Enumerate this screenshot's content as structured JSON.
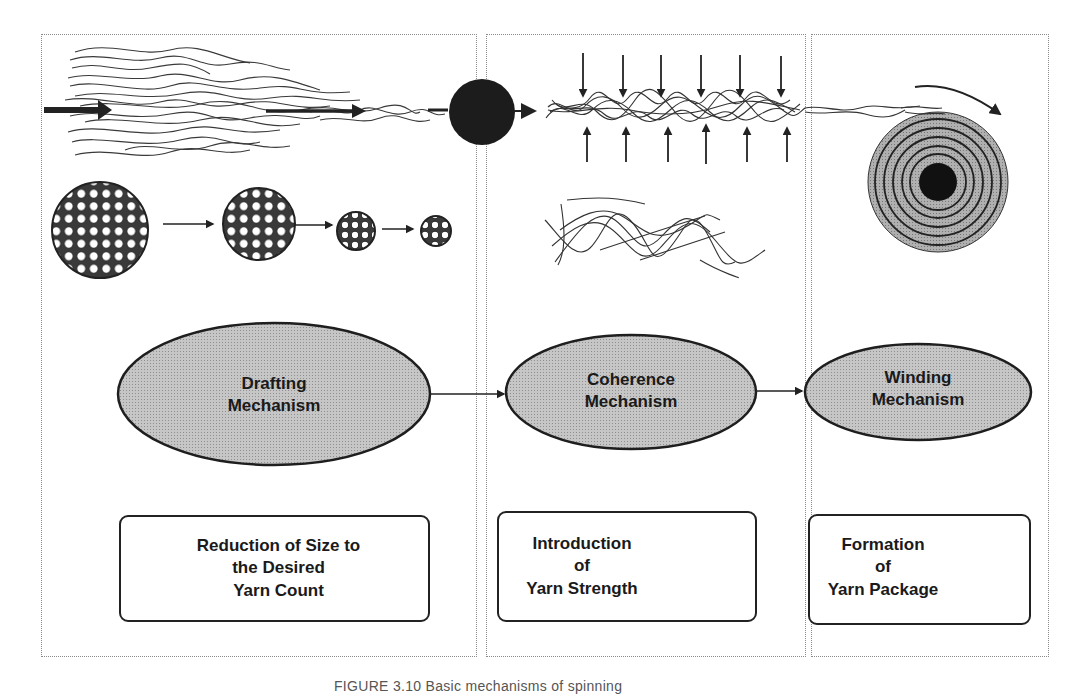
{
  "figure": {
    "caption": "FIGURE 3.10  Basic mechanisms of spinning",
    "colors": {
      "ellipse_fill": "#b9b9b9",
      "stroke": "#1e1e1e",
      "panel_border": "#8a8a8a",
      "package_fill": "#a9a9a9",
      "dark": "#111111"
    },
    "panels": [
      {
        "id": "drafting",
        "mechanism": [
          "Drafting",
          "Mechanism"
        ],
        "function": [
          "Reduction of Size to",
          "the Desired",
          "Yarn Count"
        ],
        "illustration": "fiber-strand-drafting with cross-sections reducing in size (4 circles)"
      },
      {
        "id": "coherence",
        "mechanism": [
          "Coherence",
          "Mechanism"
        ],
        "function": [
          "Introduction",
          "of",
          "Yarn Strength"
        ],
        "illustration": "fiber strand compressed by opposing arrows (6 down, 6 up) and twisted fibers"
      },
      {
        "id": "winding",
        "mechanism": [
          "Winding",
          "Mechanism"
        ],
        "function": [
          "Formation",
          "of",
          "Yarn Package"
        ],
        "illustration": "yarn wound onto concentric package with rotation arrow"
      }
    ],
    "flow": [
      "Drafting Mechanism",
      "Coherence Mechanism",
      "Winding Mechanism"
    ]
  }
}
